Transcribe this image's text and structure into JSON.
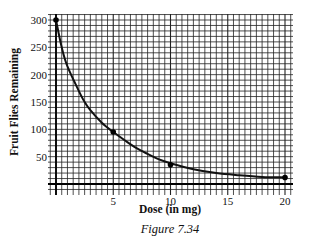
{
  "chart_data": {
    "type": "line",
    "title": "",
    "xlabel": "Dose (in mg)",
    "ylabel": "Fruit Flies Remaining",
    "xlim": [
      0,
      20
    ],
    "ylim": [
      0,
      300
    ],
    "x_ticks": [
      5,
      10,
      15,
      20
    ],
    "y_ticks": [
      50,
      100,
      150,
      200,
      250,
      300
    ],
    "grid": true,
    "series": [
      {
        "name": "Fruit flies remaining",
        "points": [
          [
            0,
            300
          ],
          [
            5,
            95
          ],
          [
            10,
            35
          ],
          [
            20,
            12
          ]
        ],
        "curve": [
          [
            0,
            300
          ],
          [
            0.5,
            250
          ],
          [
            1,
            215
          ],
          [
            2,
            170
          ],
          [
            2.5,
            150
          ],
          [
            3,
            135
          ],
          [
            4,
            112
          ],
          [
            5,
            95
          ],
          [
            6,
            80
          ],
          [
            7,
            66
          ],
          [
            8,
            55
          ],
          [
            9,
            45
          ],
          [
            10,
            38
          ],
          [
            12,
            27
          ],
          [
            14,
            20
          ],
          [
            16,
            16
          ],
          [
            18,
            13
          ],
          [
            20,
            12
          ]
        ]
      }
    ]
  },
  "caption": "Figure 7.34"
}
